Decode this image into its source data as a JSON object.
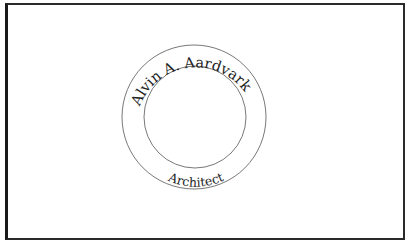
{
  "seal": {
    "name": "Alvin A. Aardvark",
    "title": "Architect",
    "center": {
      "x": 194,
      "y": 117
    },
    "outer_radius": 72,
    "inner_radius": 51,
    "ring_color": "#555555",
    "text_color": "#1e1e1e",
    "frame_color": "#2a2a2a"
  }
}
